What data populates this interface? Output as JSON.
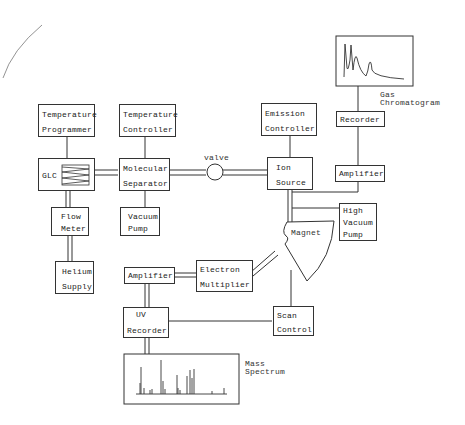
{
  "diagram": {
    "blocks": {
      "temp_programmer": {
        "line1": "Temperature",
        "line2": "Programmer"
      },
      "temp_controller": {
        "line1": "Temperature",
        "line2": "Controller"
      },
      "emission_controller": {
        "line1": "Emission",
        "line2": "Controller"
      },
      "glc": {
        "line1": "GLC"
      },
      "molecular_separator": {
        "line1": "Molecular",
        "line2": "Separator"
      },
      "ion_source": {
        "line1": "Ion",
        "line2": "Source"
      },
      "flow_meter": {
        "line1": "Flow",
        "line2": "Meter"
      },
      "vacuum_pump": {
        "line1": "Vacuum",
        "line2": "Pump"
      },
      "helium_supply": {
        "line1": "Helium",
        "line2": "Supply"
      },
      "recorder_top": {
        "line1": "Recorder"
      },
      "amplifier_top": {
        "line1": "Amplifier"
      },
      "high_vacuum_pump": {
        "line1": "High",
        "line2": "Vacuum",
        "line3": "Pump"
      },
      "magnet": {
        "line1": "Magnet"
      },
      "amplifier_bottom": {
        "line1": "Amplifier"
      },
      "electron_multiplier": {
        "line1": "Electron",
        "line2": "Multiplier"
      },
      "uv_recorder": {
        "line1": "UV",
        "line2": "Recorder"
      },
      "scan_control": {
        "line1": "Scan",
        "line2": "Control"
      }
    },
    "labels": {
      "valve": "valve",
      "gas_chromatogram_1": "Gas",
      "gas_chromatogram_2": "Chromatogram",
      "mass_spectrum_1": "Mass",
      "mass_spectrum_2": "Spectrum"
    },
    "colors": {
      "line": "#333333",
      "background": "#ffffff"
    }
  }
}
